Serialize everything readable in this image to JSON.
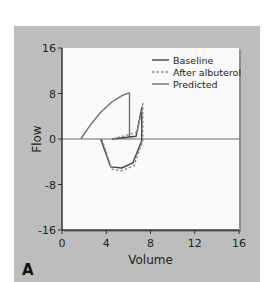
{
  "chart_data": {
    "type": "line",
    "title": "",
    "panel_label": "A",
    "xlabel": "Volume",
    "ylabel": "Flow",
    "xlim": [
      0,
      16
    ],
    "ylim": [
      -16,
      16
    ],
    "xticks": [
      0,
      4,
      8,
      12,
      16
    ],
    "yticks": [
      16,
      8,
      0,
      -8,
      -16
    ],
    "xtick_labels": [
      "0",
      "4",
      "8",
      "12",
      "16"
    ],
    "ytick_labels": [
      "16",
      "8",
      "0",
      "-8",
      "-16"
    ],
    "grid": false,
    "zero_line": true,
    "legend_position": "upper right",
    "series": [
      {
        "name": "Baseline",
        "style": "solid",
        "color": "#444444",
        "points": [
          [
            3.5,
            0
          ],
          [
            4.4,
            -4.9
          ],
          [
            5.4,
            -5.1
          ],
          [
            6.4,
            -4.2
          ],
          [
            7.2,
            -0.3
          ],
          [
            7.2,
            5.4
          ],
          [
            6.7,
            0.5
          ],
          [
            4.5,
            0
          ]
        ]
      },
      {
        "name": "After albuterol",
        "style": "dashed",
        "color": "#8a8a8a",
        "points": [
          [
            3.6,
            0
          ],
          [
            4.5,
            -5.3
          ],
          [
            5.4,
            -5.6
          ],
          [
            6.5,
            -4.7
          ],
          [
            7.3,
            -0.3
          ],
          [
            7.3,
            6.3
          ],
          [
            6.8,
            1.2
          ],
          [
            4.6,
            0
          ]
        ]
      },
      {
        "name": "Predicted",
        "style": "solid",
        "color": "#6e6e6e",
        "points": [
          [
            1.7,
            0
          ],
          [
            2.5,
            2.3
          ],
          [
            3.5,
            4.7
          ],
          [
            4.5,
            6.5
          ],
          [
            5.5,
            7.7
          ],
          [
            6.1,
            8.1
          ],
          [
            6.1,
            0.3
          ]
        ]
      }
    ]
  },
  "colors": {
    "panel_bg": "#bdbdbd",
    "plot_bg": "#fafafa",
    "axis": "#333333"
  }
}
